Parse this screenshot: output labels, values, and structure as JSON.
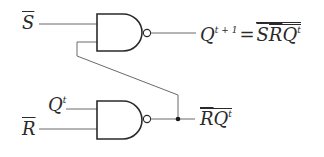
{
  "diagram": {
    "type": "SR latch built from two NAND gates",
    "colors": {
      "stroke": "#2a2a2a",
      "wire": "#6a6a6a",
      "background": "#ffffff"
    },
    "inputs": [
      {
        "id": "s_bar",
        "symbol": "S",
        "overbar": true
      },
      {
        "id": "q_t",
        "symbol": "Q",
        "superscript": "t"
      },
      {
        "id": "r_bar",
        "symbol": "R",
        "overbar": true
      }
    ],
    "gates": [
      {
        "id": "nand-top",
        "kind": "NAND",
        "inputs": [
          "S̄",
          "R̄Qᵗ (feedback)"
        ]
      },
      {
        "id": "nand-bottom",
        "kind": "NAND",
        "inputs": [
          "Qᵗ",
          "R̄"
        ]
      }
    ],
    "outputs": {
      "top": {
        "lhs": "Q",
        "lhs_sup": "t + 1",
        "equals": "=",
        "rhs_terms": [
          "S",
          "R",
          "Q"
        ],
        "rhs_sup": "t"
      },
      "bottom": {
        "terms": [
          "R",
          "Q"
        ],
        "sup": "t"
      }
    }
  }
}
